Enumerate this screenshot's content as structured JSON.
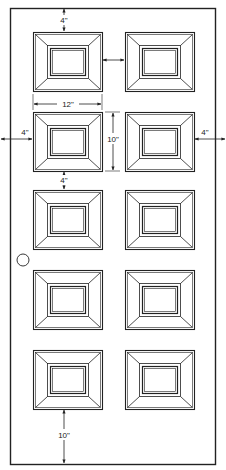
{
  "figure": {
    "type": "door-elevation-diagram"
  },
  "door": {
    "x": 10,
    "y": 8,
    "width": 205,
    "height": 456,
    "stroke": "#222222",
    "fill": "#ffffff"
  },
  "panels": {
    "columns": [
      33,
      125
    ],
    "rows": [
      32,
      112,
      190,
      270,
      350
    ],
    "width": 69,
    "height": 59,
    "count": 10
  },
  "doorknob": {
    "cx": 23,
    "cy": 260,
    "r": 6
  },
  "dimensions": {
    "top_margin": {
      "label": "4\""
    },
    "panel_width": {
      "label": "12\""
    },
    "panel_height": {
      "label": "10\""
    },
    "left_margin": {
      "label": "4\""
    },
    "right_margin": {
      "label": "4\""
    },
    "row_gap": {
      "label": "4\""
    },
    "bottom_margin": {
      "label": "10\""
    },
    "column_gap": {
      "label": ""
    }
  },
  "colors": {
    "line": "#222222",
    "background": "#ffffff"
  }
}
